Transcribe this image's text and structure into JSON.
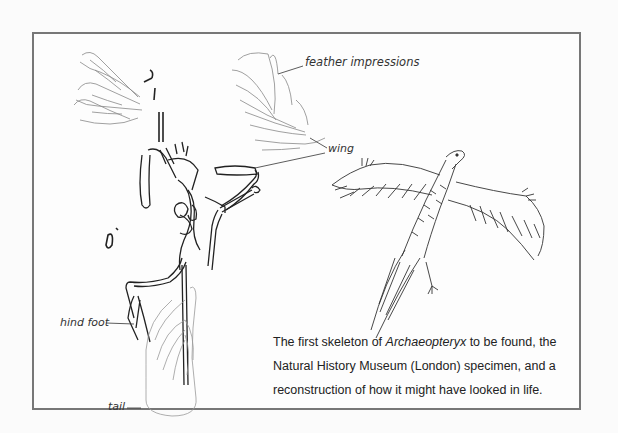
{
  "figure": {
    "labels": {
      "feather_impressions": "feather impressions",
      "wing": "wing",
      "hind_foot": "hind foot",
      "tail": "tail"
    },
    "caption": {
      "part1": "The first skeleton of ",
      "species": "Archaeopteryx",
      "part2": " to be found, the Natural History Museum (London) specimen, and a reconstruction of how it might have looked in life."
    },
    "colors": {
      "frame": "#777777",
      "ink": "#333333",
      "background": "#fdfdfd"
    }
  }
}
